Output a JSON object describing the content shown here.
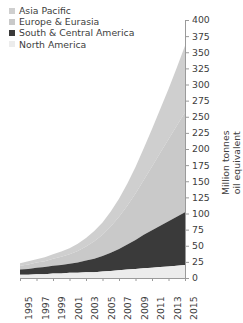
{
  "legend": {
    "items": [
      {
        "label": "Asia Pacific",
        "color": "#cfcfcf",
        "marker": "square-marker"
      },
      {
        "label": "Europe & Eurasia",
        "color": "#c9c9c9",
        "marker": "square-marker"
      },
      {
        "label": "South & Central America",
        "color": "#3a3a3a",
        "marker": "square-marker"
      },
      {
        "label": "North America",
        "color": "#ececec",
        "marker": "square-marker"
      }
    ]
  },
  "axes": {
    "y_label_line1": "Million tonnes",
    "y_label_line2": "oil equivalent",
    "y_ticks": [
      "400",
      "375",
      "350",
      "325",
      "300",
      "275",
      "250",
      "225",
      "200",
      "175",
      "150",
      "125",
      "100",
      "75",
      "50",
      "25",
      "0"
    ],
    "x_ticks": [
      "1995",
      "1997",
      "1999",
      "2001",
      "2003",
      "2005",
      "2007",
      "2009",
      "2011",
      "2013",
      "2015"
    ]
  },
  "chart_data": {
    "type": "area",
    "stacked": true,
    "title": "",
    "xlabel": "",
    "ylabel": "Million tonnes oil equivalent",
    "ylim": [
      0,
      400
    ],
    "ytick_step": 25,
    "grid": false,
    "legend_position": "top-left",
    "x": [
      1995,
      1996,
      1997,
      1998,
      1999,
      2000,
      2001,
      2002,
      2003,
      2004,
      2005,
      2006,
      2007,
      2008,
      2009,
      2010,
      2011,
      2012,
      2013,
      2014,
      2015
    ],
    "series": [
      {
        "name": "North America",
        "color": "#ececec",
        "values": [
          5,
          5,
          6,
          6,
          7,
          7,
          8,
          8,
          9,
          9,
          10,
          11,
          12,
          13,
          14,
          15,
          16,
          17,
          18,
          19,
          20
        ]
      },
      {
        "name": "South & Central America",
        "color": "#3a3a3a",
        "values": [
          8,
          9,
          10,
          11,
          12,
          13,
          14,
          16,
          18,
          21,
          24,
          28,
          33,
          39,
          45,
          52,
          58,
          64,
          70,
          76,
          82
        ]
      },
      {
        "name": "Europe & Eurasia",
        "color": "#c9c9c9",
        "values": [
          6,
          7,
          8,
          9,
          11,
          13,
          15,
          18,
          22,
          27,
          33,
          41,
          50,
          60,
          72,
          85,
          99,
          113,
          127,
          141,
          155
        ]
      },
      {
        "name": "Asia Pacific",
        "color": "#cfcfcf",
        "values": [
          4,
          5,
          5,
          6,
          7,
          8,
          9,
          11,
          13,
          16,
          19,
          23,
          28,
          34,
          41,
          49,
          58,
          68,
          78,
          90,
          103
        ]
      }
    ],
    "totals": [
      23,
      26,
      29,
      32,
      37,
      41,
      46,
      53,
      62,
      73,
      86,
      103,
      123,
      146,
      172,
      201,
      231,
      262,
      293,
      326,
      360
    ]
  },
  "colors": {
    "axis": "#9a9a9a",
    "text": "#3d3d3d",
    "background": "#ffffff"
  }
}
